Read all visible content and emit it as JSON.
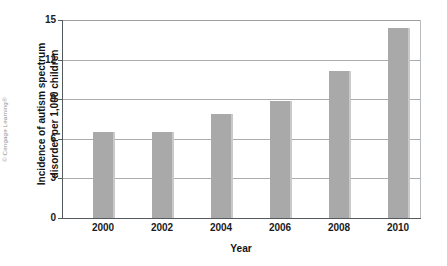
{
  "figure": {
    "copyright": "© Cengage Learning®"
  },
  "chart_data": {
    "type": "bar",
    "title": "",
    "xlabel": "Year",
    "ylabel_line1": "Incidence of autism spectrum",
    "ylabel_line2": "disorder per 1,000 children",
    "ylabel": "Incidence of autism spectrum disorder per 1,000 children",
    "categories": [
      "2000",
      "2002",
      "2004",
      "2006",
      "2008",
      "2010"
    ],
    "values": [
      6.5,
      6.5,
      7.9,
      8.9,
      11.1,
      14.4
    ],
    "ylim": [
      0,
      15
    ],
    "yticks": [
      0,
      3,
      6,
      9,
      12,
      15
    ],
    "ytick_labels": [
      "0",
      "3",
      "6",
      "9",
      "12",
      "15"
    ],
    "grid": true,
    "grid_axis": "y",
    "legend": "none",
    "bar_color": "#a9a9a9",
    "axis_color": "#555a5e",
    "gridline_color": "#a9adb0",
    "background": "#ffffff"
  }
}
